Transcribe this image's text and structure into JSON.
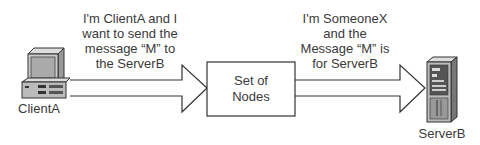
{
  "client": {
    "label": "ClientA"
  },
  "server": {
    "label": "ServerB"
  },
  "nodes": {
    "line1": "Set of",
    "line2": "Nodes"
  },
  "message_left": {
    "lines": [
      "I'm ClientA and I",
      "want to send the",
      "message “M” to",
      "the ServerB"
    ]
  },
  "message_right": {
    "lines": [
      "I'm SomeoneX",
      "and the",
      "Message “M” is",
      "for ServerB"
    ]
  }
}
